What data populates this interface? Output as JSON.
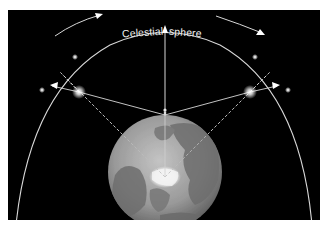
{
  "diagram": {
    "title_left": "Celestial",
    "title_right": "sphere",
    "colors": {
      "background": "#000000",
      "line": "#d8d8d8",
      "earth_light": "#b9b9b9",
      "earth_dark": "#6e6e6e",
      "polar_ice": "#f4f4f4"
    },
    "elements": {
      "celestial_sphere": "arc",
      "earth": "globe viewed from above north pole",
      "observer": "person on globe",
      "stars": [
        {
          "name": "bright-star-left",
          "x": 79,
          "y": 92
        },
        {
          "name": "bright-star-right",
          "x": 250,
          "y": 92
        },
        {
          "name": "projected-star-left-lower",
          "x": 42,
          "y": 90
        },
        {
          "name": "projected-star-left-upper",
          "x": 75,
          "y": 57
        },
        {
          "name": "projected-star-right-upper",
          "x": 255,
          "y": 57
        },
        {
          "name": "projected-star-right-lower",
          "x": 288,
          "y": 90
        }
      ]
    }
  }
}
